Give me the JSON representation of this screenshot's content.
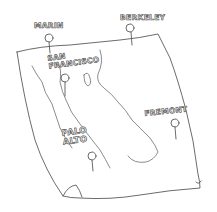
{
  "map": {
    "style": "hand-drawn sketch",
    "stroke_color": "#555555",
    "background": "#ffffff",
    "pins": [
      {
        "id": "marin",
        "label": "MARIN"
      },
      {
        "id": "berkeley",
        "label": "BERKELEY"
      },
      {
        "id": "san-francisco",
        "label": "SAN\nFRANCISCO"
      },
      {
        "id": "palo-alto",
        "label": "PALO\nALTO"
      },
      {
        "id": "fremont",
        "label": "FREMONT"
      }
    ]
  }
}
